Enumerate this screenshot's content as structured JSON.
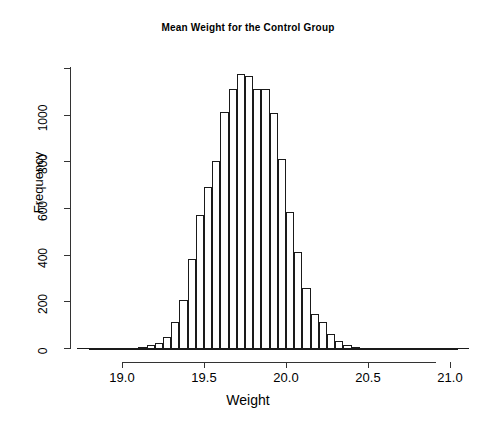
{
  "chart_data": {
    "type": "bar",
    "title": "Mean Weight for the Control Group",
    "xlabel": "Weight",
    "ylabel": "Frequency",
    "xlim": [
      18.8,
      21.05
    ],
    "ylim": [
      0,
      1200
    ],
    "grid": false,
    "legend": null,
    "bin_width": 0.05,
    "bar_color": "#ffffff",
    "bar_edge_color": "#1a1a1a",
    "axis_color": "#333333",
    "xticks": [
      19.0,
      19.5,
      20.0,
      20.5,
      21.0
    ],
    "xtick_labels": [
      "19.0",
      "19.5",
      "20.0",
      "20.5",
      "21.0"
    ],
    "yticks": [
      0,
      200,
      400,
      600,
      800,
      1000,
      1200
    ],
    "ytick_labels": [
      "0",
      "200",
      "400",
      "600",
      "800",
      "1000",
      ""
    ],
    "categories": [
      "18.80",
      "18.85",
      "18.90",
      "18.95",
      "19.00",
      "19.05",
      "19.10",
      "19.15",
      "19.20",
      "19.25",
      "19.30",
      "19.35",
      "19.40",
      "19.45",
      "19.50",
      "19.55",
      "19.60",
      "19.65",
      "19.70",
      "19.75",
      "19.80",
      "19.85",
      "19.90",
      "19.95",
      "20.00",
      "20.05",
      "20.10",
      "20.15",
      "20.20",
      "20.25",
      "20.30",
      "20.35",
      "20.40",
      "20.45",
      "20.50",
      "20.55",
      "20.60",
      "20.65",
      "20.70",
      "20.75",
      "20.80",
      "20.85",
      "20.90",
      "20.95",
      "21.00"
    ],
    "bin_left_edges": [
      18.8,
      18.85,
      18.9,
      18.95,
      19.0,
      19.05,
      19.1,
      19.15,
      19.2,
      19.25,
      19.3,
      19.35,
      19.4,
      19.45,
      19.5,
      19.55,
      19.6,
      19.65,
      19.7,
      19.75,
      19.8,
      19.85,
      19.9,
      19.95,
      20.0,
      20.05,
      20.1,
      20.15,
      20.2,
      20.25,
      20.3,
      20.35,
      20.4,
      20.45,
      20.5,
      20.55,
      20.6,
      20.65,
      20.7,
      20.75,
      20.8,
      20.85,
      20.9,
      20.95,
      21.0
    ],
    "values": [
      4,
      3,
      3,
      5,
      8,
      10,
      14,
      20,
      30,
      55,
      120,
      215,
      390,
      580,
      700,
      810,
      1020,
      1120,
      1185,
      1175,
      1120,
      1120,
      1015,
      820,
      590,
      420,
      265,
      155,
      120,
      70,
      40,
      22,
      12,
      8,
      5,
      3,
      2,
      2,
      1,
      1,
      1,
      1,
      1,
      1,
      1
    ]
  }
}
